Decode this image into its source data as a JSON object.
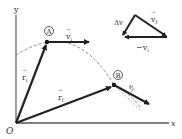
{
  "diagram": {
    "axes": {
      "x_label": "x",
      "y_label": "y",
      "origin_label": "O"
    },
    "points": {
      "A": {
        "label": "A"
      },
      "B": {
        "label": "B"
      }
    },
    "vectors": {
      "r_i": {
        "symbol": "r",
        "subscript": "i"
      },
      "r_f": {
        "symbol": "r",
        "subscript": "f"
      },
      "v_i": {
        "symbol": "v",
        "subscript": "i"
      },
      "v_f": {
        "symbol": "v",
        "subscript": "f"
      }
    },
    "triangle": {
      "delta_v": {
        "prefix": "Δ",
        "symbol": "v"
      },
      "v_f": {
        "symbol": "v",
        "subscript": "f"
      },
      "neg_v_i": {
        "prefix": "−",
        "symbol": "v",
        "subscript": "i"
      }
    },
    "colors": {
      "vector": "#222222",
      "axis": "#555555",
      "path": "#888888",
      "text": "#333333"
    }
  }
}
